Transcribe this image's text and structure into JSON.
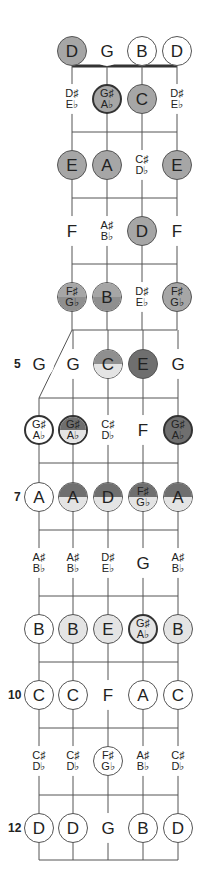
{
  "colors": {
    "light": "#e4e4e4",
    "medium": "#a6a6a6",
    "mediumdark": "#8f8f8f",
    "dark": "#6f6f6f",
    "line": "#555555",
    "nut": "#333333"
  },
  "layout": {
    "strings_upper_x": [
      72,
      107,
      142,
      177
    ],
    "strings_lower_x": [
      39,
      73,
      108,
      143,
      178
    ],
    "nut_y": 66,
    "fret_lines_y": [
      132,
      198,
      264,
      330,
      398,
      463,
      530,
      596,
      662,
      728,
      795,
      860
    ],
    "row_y": [
      51,
      99,
      165,
      231,
      297,
      364,
      430,
      497,
      563,
      629,
      695,
      761,
      828
    ]
  },
  "fret_markers": [
    {
      "fret": 5,
      "label": "5",
      "x": 14
    },
    {
      "fret": 7,
      "label": "7",
      "x": 14
    },
    {
      "fret": 10,
      "label": "10",
      "x": 8
    },
    {
      "fret": 12,
      "label": "12",
      "x": 8
    }
  ],
  "rows": [
    {
      "fret": 0,
      "notes": [
        {
          "s": 0,
          "top": "D",
          "style": "fill",
          "fill": "medium"
        },
        {
          "s": 1,
          "top": "G",
          "style": "text"
        },
        {
          "s": 2,
          "top": "B",
          "style": "circle"
        },
        {
          "s": 3,
          "top": "D",
          "style": "circle"
        }
      ]
    },
    {
      "fret": 1,
      "notes": [
        {
          "s": 0,
          "top": "D♯",
          "bot": "E♭",
          "style": "text"
        },
        {
          "s": 1,
          "top": "G♯",
          "bot": "A♭",
          "style": "bold",
          "fill": "medium"
        },
        {
          "s": 2,
          "top": "C",
          "style": "fill",
          "fill": "medium"
        },
        {
          "s": 3,
          "top": "D♯",
          "bot": "E♭",
          "style": "text"
        }
      ]
    },
    {
      "fret": 2,
      "notes": [
        {
          "s": 0,
          "top": "E",
          "style": "fill",
          "fill": "medium"
        },
        {
          "s": 1,
          "top": "A",
          "style": "fill",
          "fill": "medium"
        },
        {
          "s": 2,
          "top": "C♯",
          "bot": "D♭",
          "style": "text"
        },
        {
          "s": 3,
          "top": "E",
          "style": "fill",
          "fill": "medium"
        }
      ]
    },
    {
      "fret": 3,
      "notes": [
        {
          "s": 0,
          "top": "F",
          "style": "text"
        },
        {
          "s": 1,
          "top": "A♯",
          "bot": "B♭",
          "style": "text"
        },
        {
          "s": 2,
          "top": "D",
          "style": "fill",
          "fill": "medium"
        },
        {
          "s": 3,
          "top": "F",
          "style": "text"
        }
      ]
    },
    {
      "fret": 4,
      "notes": [
        {
          "s": 0,
          "top": "F♯",
          "bot": "G♭",
          "style": "half",
          "fill_top": "medium",
          "fill_bot": "mediumdark"
        },
        {
          "s": 1,
          "top": "B",
          "style": "half",
          "fill_top": "medium",
          "fill_bot": "mediumdark"
        },
        {
          "s": 2,
          "top": "D♯",
          "bot": "E♭",
          "style": "text"
        },
        {
          "s": 3,
          "top": "F♯",
          "bot": "G♭",
          "style": "fill",
          "fill": "medium"
        }
      ]
    },
    {
      "fret": 5,
      "notes": [
        {
          "s": 0,
          "top": "G",
          "style": "text",
          "lower": true
        },
        {
          "s": 1,
          "top": "G",
          "style": "text",
          "lower": true
        },
        {
          "s": 2,
          "top": "C",
          "style": "half",
          "fill_top": "mediumdark",
          "fill_bot": "light",
          "lower": true
        },
        {
          "s": 3,
          "top": "E",
          "style": "fill",
          "fill": "dark",
          "lower": true
        },
        {
          "s": 4,
          "top": "G",
          "style": "text",
          "lower": true
        }
      ]
    },
    {
      "fret": 6,
      "notes": [
        {
          "s": 0,
          "top": "G♯",
          "bot": "A♭",
          "style": "bold",
          "lower": true
        },
        {
          "s": 1,
          "top": "G♯",
          "bot": "A♭",
          "style": "halfbold",
          "fill_top": "dark",
          "fill_bot": "light",
          "lower": true
        },
        {
          "s": 2,
          "top": "C♯",
          "bot": "D♭",
          "style": "text",
          "lower": true
        },
        {
          "s": 3,
          "top": "F",
          "style": "text",
          "lower": true
        },
        {
          "s": 4,
          "top": "G♯",
          "bot": "A♭",
          "style": "bold",
          "fill": "dark",
          "lower": true
        }
      ]
    },
    {
      "fret": 7,
      "notes": [
        {
          "s": 0,
          "top": "A",
          "style": "circle",
          "lower": true
        },
        {
          "s": 1,
          "top": "A",
          "style": "half",
          "fill_top": "dark",
          "fill_bot": "light",
          "lower": true
        },
        {
          "s": 2,
          "top": "D",
          "style": "half",
          "fill_top": "dark",
          "fill_bot": "light",
          "lower": true
        },
        {
          "s": 3,
          "top": "F♯",
          "bot": "G♭",
          "style": "half",
          "fill_top": "dark",
          "fill_bot": "light",
          "lower": true
        },
        {
          "s": 4,
          "top": "A",
          "style": "half",
          "fill_top": "dark",
          "fill_bot": "light",
          "lower": true
        }
      ]
    },
    {
      "fret": 8,
      "notes": [
        {
          "s": 0,
          "top": "A♯",
          "bot": "B♭",
          "style": "text",
          "lower": true
        },
        {
          "s": 1,
          "top": "A♯",
          "bot": "B♭",
          "style": "text",
          "lower": true
        },
        {
          "s": 2,
          "top": "D♯",
          "bot": "E♭",
          "style": "text",
          "lower": true
        },
        {
          "s": 3,
          "top": "G",
          "style": "text",
          "lower": true
        },
        {
          "s": 4,
          "top": "A♯",
          "bot": "B♭",
          "style": "text",
          "lower": true
        }
      ]
    },
    {
      "fret": 9,
      "notes": [
        {
          "s": 0,
          "top": "B",
          "style": "circle",
          "lower": true
        },
        {
          "s": 1,
          "top": "B",
          "style": "circle",
          "fill": "light",
          "lower": true
        },
        {
          "s": 2,
          "top": "E",
          "style": "circle",
          "fill": "light",
          "lower": true
        },
        {
          "s": 3,
          "top": "G♯",
          "bot": "A♭",
          "style": "bold",
          "fill": "light",
          "lower": true
        },
        {
          "s": 4,
          "top": "B",
          "style": "circle",
          "fill": "light",
          "lower": true
        }
      ]
    },
    {
      "fret": 10,
      "notes": [
        {
          "s": 0,
          "top": "C",
          "style": "circle",
          "lower": true
        },
        {
          "s": 1,
          "top": "C",
          "style": "circle",
          "lower": true
        },
        {
          "s": 2,
          "top": "F",
          "style": "text",
          "lower": true
        },
        {
          "s": 3,
          "top": "A",
          "style": "circle",
          "lower": true
        },
        {
          "s": 4,
          "top": "C",
          "style": "circle",
          "lower": true
        }
      ]
    },
    {
      "fret": 11,
      "notes": [
        {
          "s": 0,
          "top": "C♯",
          "bot": "D♭",
          "style": "text",
          "lower": true
        },
        {
          "s": 1,
          "top": "C♯",
          "bot": "D♭",
          "style": "text",
          "lower": true
        },
        {
          "s": 2,
          "top": "F♯",
          "bot": "G♭",
          "style": "circle",
          "lower": true
        },
        {
          "s": 3,
          "top": "A♯",
          "bot": "B♭",
          "style": "text",
          "lower": true
        },
        {
          "s": 4,
          "top": "C♯",
          "bot": "D♭",
          "style": "text",
          "lower": true
        }
      ]
    },
    {
      "fret": 12,
      "notes": [
        {
          "s": 0,
          "top": "D",
          "style": "circle",
          "lower": true
        },
        {
          "s": 1,
          "top": "D",
          "style": "circle",
          "lower": true
        },
        {
          "s": 2,
          "top": "G",
          "style": "text",
          "lower": true
        },
        {
          "s": 3,
          "top": "B",
          "style": "circle",
          "lower": true
        },
        {
          "s": 4,
          "top": "D",
          "style": "circle",
          "lower": true
        }
      ]
    }
  ]
}
